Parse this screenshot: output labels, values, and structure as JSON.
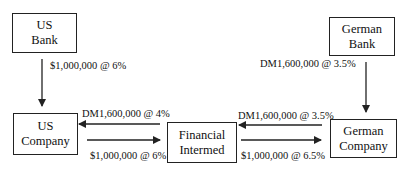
{
  "nodes": {
    "us_bank": {
      "line1": "US",
      "line2": "Bank"
    },
    "german_bank": {
      "line1": "German",
      "line2": "Bank"
    },
    "us_company": {
      "line1": "US",
      "line2": "Company"
    },
    "financial_intermediary": {
      "line1": "Financial",
      "line2": "Intermed"
    },
    "german_company": {
      "line1": "German",
      "line2": "Company"
    }
  },
  "flows": {
    "us_bank_to_us_company": "$1,000,000 @ 6%",
    "german_bank_to_german_company": "DM1,600,000 @ 3.5%",
    "fi_to_us_company": "DM1,600,000 @ 4%",
    "us_company_to_fi": "$1,000,000 @ 6%",
    "german_company_to_fi": "DM1,600,000 @ 3.5%",
    "fi_to_german_company": "$1,000,000 @ 6.5%"
  },
  "colors": {
    "line": "#222222",
    "background": "#ffffff"
  }
}
